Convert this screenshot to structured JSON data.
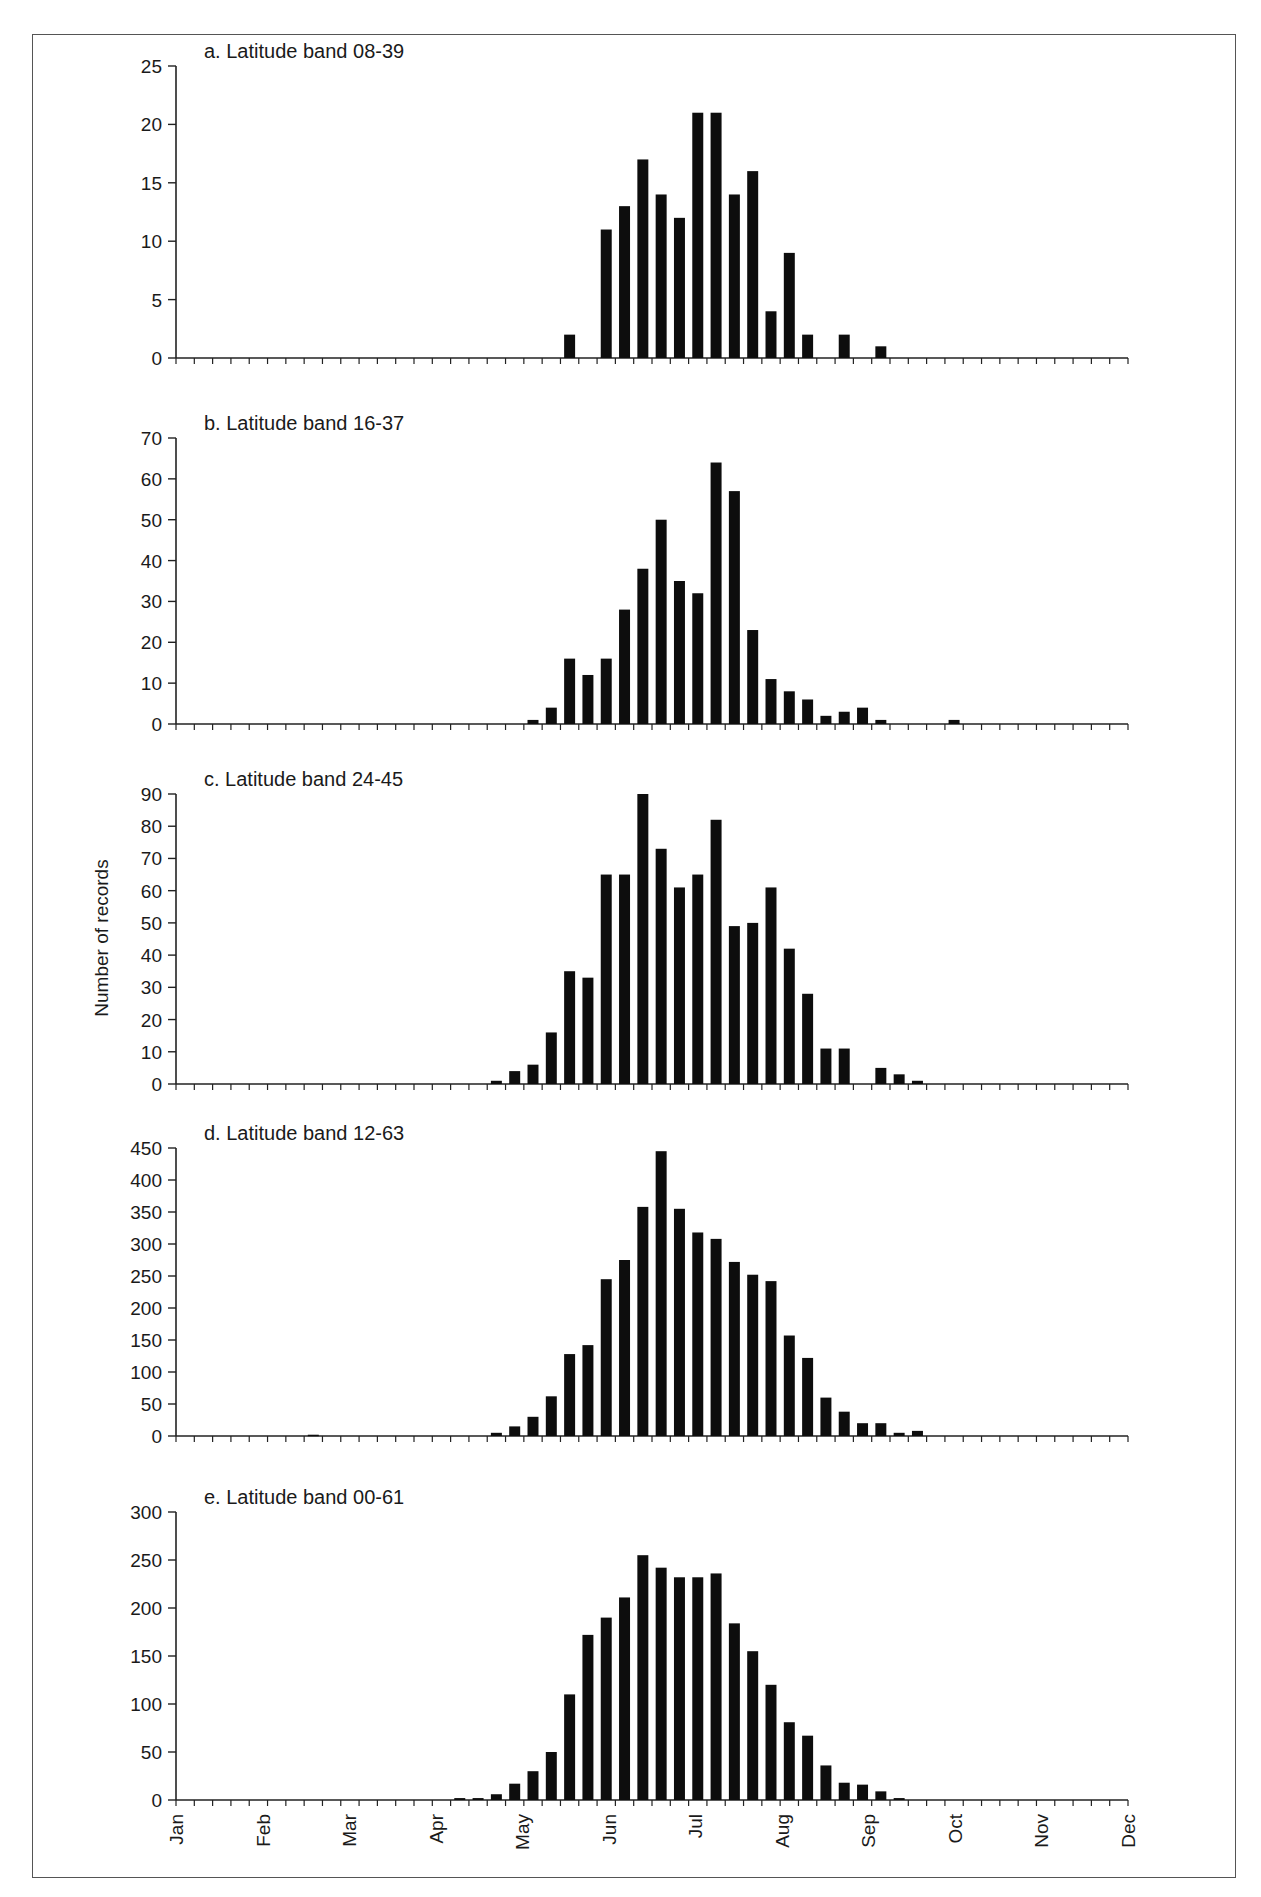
{
  "figure": {
    "y_axis_label": "Number of records",
    "months": [
      "Jan",
      "Feb",
      "Mar",
      "Apr",
      "May",
      "Jun",
      "Jul",
      "Aug",
      "Sep",
      "Oct",
      "Nov",
      "Dec"
    ],
    "bins": 52
  },
  "chart_data": [
    {
      "type": "bar",
      "title": "a.  Latitude band 08-39",
      "xlabel": "",
      "ylabel": "Number of records",
      "ylim": [
        0,
        25
      ],
      "yticks": [
        0,
        5,
        10,
        15,
        20,
        25
      ],
      "x_unit": "week index (0-51, Jan-Dec)",
      "points": [
        [
          21,
          2
        ],
        [
          23,
          11
        ],
        [
          24,
          13
        ],
        [
          25,
          17
        ],
        [
          26,
          14
        ],
        [
          27,
          12
        ],
        [
          28,
          21
        ],
        [
          29,
          21
        ],
        [
          30,
          14
        ],
        [
          31,
          16
        ],
        [
          32,
          4
        ],
        [
          33,
          9
        ],
        [
          34,
          2
        ],
        [
          36,
          2
        ],
        [
          38,
          1
        ]
      ]
    },
    {
      "type": "bar",
      "title": "b.  Latitude band 16-37",
      "xlabel": "",
      "ylabel": "Number of records",
      "ylim": [
        0,
        70
      ],
      "yticks": [
        0,
        10,
        20,
        30,
        40,
        50,
        60,
        70
      ],
      "x_unit": "week index (0-51, Jan-Dec)",
      "points": [
        [
          19,
          1
        ],
        [
          20,
          4
        ],
        [
          21,
          16
        ],
        [
          22,
          12
        ],
        [
          23,
          16
        ],
        [
          24,
          28
        ],
        [
          25,
          38
        ],
        [
          26,
          50
        ],
        [
          27,
          35
        ],
        [
          28,
          32
        ],
        [
          29,
          64
        ],
        [
          30,
          57
        ],
        [
          31,
          23
        ],
        [
          32,
          11
        ],
        [
          33,
          8
        ],
        [
          34,
          6
        ],
        [
          35,
          2
        ],
        [
          36,
          3
        ],
        [
          37,
          4
        ],
        [
          38,
          1
        ],
        [
          42,
          1
        ]
      ]
    },
    {
      "type": "bar",
      "title": "c.  Latitude band 24-45",
      "xlabel": "",
      "ylabel": "Number of records",
      "ylim": [
        0,
        90
      ],
      "yticks": [
        0,
        10,
        20,
        30,
        40,
        50,
        60,
        70,
        80,
        90
      ],
      "x_unit": "week index (0-51, Jan-Dec)",
      "points": [
        [
          17,
          1
        ],
        [
          18,
          4
        ],
        [
          19,
          6
        ],
        [
          20,
          16
        ],
        [
          21,
          35
        ],
        [
          22,
          33
        ],
        [
          23,
          65
        ],
        [
          24,
          65
        ],
        [
          25,
          90
        ],
        [
          26,
          73
        ],
        [
          27,
          61
        ],
        [
          28,
          65
        ],
        [
          29,
          82
        ],
        [
          30,
          49
        ],
        [
          31,
          50
        ],
        [
          32,
          61
        ],
        [
          33,
          42
        ],
        [
          34,
          28
        ],
        [
          35,
          11
        ],
        [
          36,
          11
        ],
        [
          38,
          5
        ],
        [
          39,
          3
        ],
        [
          40,
          1
        ]
      ]
    },
    {
      "type": "bar",
      "title": "d.  Latitude band 12-63",
      "xlabel": "",
      "ylabel": "Number of records",
      "ylim": [
        0,
        450
      ],
      "yticks": [
        0,
        50,
        100,
        150,
        200,
        250,
        300,
        350,
        400,
        450
      ],
      "x_unit": "week index (0-51, Jan-Dec)",
      "points": [
        [
          7,
          2
        ],
        [
          17,
          5
        ],
        [
          18,
          15
        ],
        [
          19,
          30
        ],
        [
          20,
          62
        ],
        [
          21,
          128
        ],
        [
          22,
          142
        ],
        [
          23,
          245
        ],
        [
          24,
          275
        ],
        [
          25,
          358
        ],
        [
          26,
          445
        ],
        [
          27,
          355
        ],
        [
          28,
          318
        ],
        [
          29,
          308
        ],
        [
          30,
          272
        ],
        [
          31,
          252
        ],
        [
          32,
          242
        ],
        [
          33,
          157
        ],
        [
          34,
          122
        ],
        [
          35,
          60
        ],
        [
          36,
          38
        ],
        [
          37,
          20
        ],
        [
          38,
          20
        ],
        [
          39,
          5
        ],
        [
          40,
          8
        ]
      ]
    },
    {
      "type": "bar",
      "title": "e.  Latitude band 00-61",
      "xlabel": "",
      "ylabel": "Number of records",
      "ylim": [
        0,
        300
      ],
      "yticks": [
        0,
        50,
        100,
        150,
        200,
        250,
        300
      ],
      "x_unit": "week index (0-51, Jan-Dec)",
      "xticklabels": [
        "Jan",
        "Feb",
        "Mar",
        "Apr",
        "May",
        "Jun",
        "Jul",
        "Aug",
        "Sep",
        "Oct",
        "Nov",
        "Dec"
      ],
      "points": [
        [
          15,
          2
        ],
        [
          16,
          2
        ],
        [
          17,
          6
        ],
        [
          18,
          17
        ],
        [
          19,
          30
        ],
        [
          20,
          50
        ],
        [
          21,
          110
        ],
        [
          22,
          172
        ],
        [
          23,
          190
        ],
        [
          24,
          211
        ],
        [
          25,
          255
        ],
        [
          26,
          242
        ],
        [
          27,
          232
        ],
        [
          28,
          232
        ],
        [
          29,
          236
        ],
        [
          30,
          184
        ],
        [
          31,
          155
        ],
        [
          32,
          120
        ],
        [
          33,
          81
        ],
        [
          34,
          67
        ],
        [
          35,
          36
        ],
        [
          36,
          18
        ],
        [
          37,
          16
        ],
        [
          38,
          9
        ],
        [
          39,
          2
        ]
      ]
    }
  ]
}
